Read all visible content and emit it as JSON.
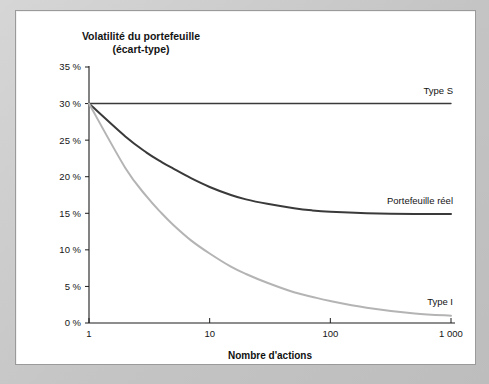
{
  "panel": {
    "background_color": "#ffffff",
    "frame_color": "#c8c8c8"
  },
  "title": {
    "line1": "Volatilité du portefeuille",
    "line2": "(écart-type)"
  },
  "chart_data": {
    "type": "line",
    "title": "Volatilité du portefeuille (écart-type)",
    "xlabel": "Nombre d'actions",
    "ylabel": "Volatilité du portefeuille (écart-type)",
    "xscale": "log",
    "xlim": [
      1,
      1000
    ],
    "ylim": [
      0,
      35
    ],
    "grid": false,
    "legend_position": "inline-right",
    "xticks": [
      1,
      10,
      100,
      1000
    ],
    "xticklabels": [
      "1",
      "10",
      "100",
      "1 000"
    ],
    "yticks": [
      0,
      5,
      10,
      15,
      20,
      25,
      30,
      35
    ],
    "yticklabels": [
      "0 %",
      "5 %",
      "10 %",
      "15 %",
      "20 %",
      "25 %",
      "30 %",
      "35 %"
    ],
    "series": [
      {
        "name": "Type S",
        "label": "Type S",
        "color": "#3a3a3a",
        "width": 1.4,
        "x": [
          1,
          2,
          5,
          10,
          20,
          50,
          100,
          200,
          500,
          1000
        ],
        "values": [
          30,
          30,
          30,
          30,
          30,
          30,
          30,
          30,
          30,
          30
        ]
      },
      {
        "name": "Portefeuille réel",
        "label": "Portefeuille réel",
        "color": "#3a3a3a",
        "width": 2.0,
        "x": [
          1,
          2,
          3,
          4,
          5,
          7,
          10,
          15,
          20,
          30,
          50,
          70,
          100,
          200,
          500,
          1000
        ],
        "values": [
          30,
          25.5,
          23.3,
          22.0,
          21.1,
          19.8,
          18.6,
          17.5,
          16.9,
          16.3,
          15.7,
          15.4,
          15.2,
          15.0,
          14.9,
          14.9
        ]
      },
      {
        "name": "Type I",
        "label": "Type I",
        "color": "#b4b4b4",
        "width": 2.0,
        "x": [
          1,
          2,
          3,
          4,
          5,
          7,
          10,
          15,
          20,
          30,
          50,
          70,
          100,
          200,
          500,
          1000
        ],
        "values": [
          30,
          21.2,
          17.3,
          15.0,
          13.4,
          11.3,
          9.5,
          7.7,
          6.7,
          5.5,
          4.2,
          3.6,
          3.0,
          2.1,
          1.3,
          1.0
        ]
      }
    ],
    "annotations": [
      {
        "text": "Type S",
        "x": 1000,
        "y": 31.3
      },
      {
        "text": "Portefeuille réel",
        "x": 1000,
        "y": 16.3
      },
      {
        "text": "Type I",
        "x": 1000,
        "y": 2.4
      }
    ]
  },
  "axis": {
    "x_title": "Nombre d'actions"
  }
}
